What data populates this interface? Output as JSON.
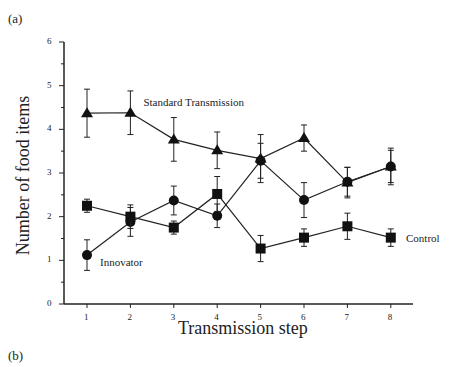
{
  "panels": {
    "a": "(a)",
    "b": "(b)"
  },
  "chart_data": {
    "type": "line",
    "title": "",
    "xlabel": "Transmission step",
    "ylabel": "Number of food items",
    "x": [
      1,
      2,
      3,
      4,
      5,
      6,
      7,
      8
    ],
    "xlim": [
      0.5,
      8.5
    ],
    "ylim": [
      0,
      6
    ],
    "yticks": [
      0,
      1,
      2,
      3,
      4,
      5,
      6
    ],
    "grid": false,
    "legend": "inline labels",
    "series": [
      {
        "name": "Standard Transmission",
        "marker": "triangle",
        "values": [
          4.37,
          4.38,
          3.77,
          3.52,
          3.33,
          3.8,
          2.78,
          3.15
        ],
        "errors": [
          0.55,
          0.5,
          0.5,
          0.42,
          0.55,
          0.3,
          0.35,
          0.42
        ]
      },
      {
        "name": "Innovator",
        "marker": "circle",
        "values": [
          1.12,
          1.88,
          2.37,
          2.02,
          3.28,
          2.38,
          2.8,
          3.15
        ],
        "errors": [
          0.35,
          0.33,
          0.33,
          0.27,
          0.4,
          0.4,
          0.33,
          0.37
        ]
      },
      {
        "name": "Control",
        "marker": "square",
        "values": [
          2.25,
          2.0,
          1.75,
          2.52,
          1.27,
          1.52,
          1.78,
          1.52
        ],
        "errors": [
          0.15,
          0.27,
          0.15,
          0.4,
          0.3,
          0.2,
          0.3,
          0.2
        ]
      }
    ],
    "annotations": [
      {
        "text": "Standard Transmission",
        "x": 2.3,
        "y": 4.6
      },
      {
        "text": "Innovator",
        "x": 1.3,
        "y": 0.95
      },
      {
        "text": "Control",
        "x": 8.35,
        "y": 1.5
      }
    ]
  }
}
